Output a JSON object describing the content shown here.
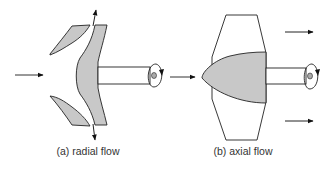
{
  "diagram": {
    "type": "turbomachine-flow-comparison",
    "panels": [
      {
        "id": "a",
        "caption": "(a) radial flow",
        "components": [
          "inlet-arrow",
          "shroud-upper",
          "shroud-lower",
          "impeller-disc",
          "shaft",
          "rotation-indicator",
          "outlet-arrow-up",
          "outlet-arrow-down"
        ]
      },
      {
        "id": "b",
        "caption": "(b) axial flow",
        "components": [
          "inlet-arrow",
          "blade",
          "hub",
          "shaft",
          "rotation-indicator",
          "outlet-arrow-top",
          "outlet-arrow-bottom"
        ]
      }
    ],
    "colors": {
      "fill": "#c8c8c8",
      "stroke": "#222222",
      "background": "#ffffff"
    }
  }
}
